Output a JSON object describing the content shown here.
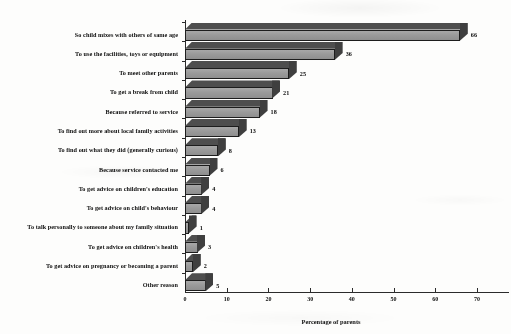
{
  "chart_data": {
    "type": "bar",
    "orientation": "horizontal",
    "title": "",
    "xlabel": "Percentage of parents",
    "ylabel": "",
    "xlim": [
      0,
      70
    ],
    "xticks": [
      0,
      10,
      20,
      30,
      40,
      50,
      60,
      70
    ],
    "grid": false,
    "legend": false,
    "style": "3d-bar-grayscale",
    "categories": [
      "So child mixes with others of same age",
      "To use the facilities, toys or equipment",
      "To meet other parents",
      "To get a break from child",
      "Because referred to service",
      "To find out more about local family activities",
      "To find out what they did (generally curious)",
      "Because service contacted me",
      "To get advice on children's education",
      "To get advice on child's behaviour",
      "To talk personally to someone about my family situation",
      "To get advice on children's health",
      "To get advice on pregnancy or becoming a parent",
      "Other reason"
    ],
    "values": [
      66,
      36,
      25,
      21,
      18,
      13,
      8,
      6,
      4,
      4,
      1,
      3,
      2,
      5
    ],
    "data_labels": [
      "66",
      "36",
      "25",
      "21",
      "18",
      "13",
      "8",
      "6",
      "4",
      "4",
      "1",
      "3",
      "2",
      "5"
    ],
    "colors": {
      "bar_front": "#9c9c9c",
      "bar_top": "#4e4e4e",
      "bar_side": "#3a3a3a",
      "outline": "#1d1d1d",
      "axis": "#2b2b2b",
      "text": "#0d0d0d",
      "background": "#fdfdfc"
    }
  },
  "axis": {
    "x_tick_labels": [
      "0",
      "10",
      "20",
      "30",
      "40",
      "50",
      "60",
      "70"
    ],
    "x_title": "Percentage of parents"
  }
}
